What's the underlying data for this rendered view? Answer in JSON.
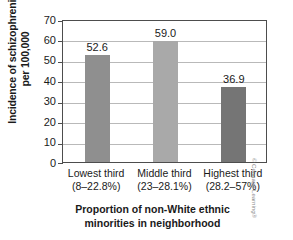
{
  "chart_data": {
    "type": "bar",
    "title": "",
    "categories": [
      "Lowest third",
      "Middle third",
      "Highest third"
    ],
    "category_ranges": [
      "(8–22.8%)",
      "(23–28.1%)",
      "(28.2–57%)"
    ],
    "values": [
      52.6,
      59.0,
      36.9
    ],
    "value_labels": [
      "52.6",
      "59.0",
      "36.9"
    ],
    "bar_colors": [
      "#8f8f8f",
      "#a9a9a9",
      "#757575"
    ],
    "xlabel_line1": "Proportion of non-White ethnic",
    "xlabel_line2": "minorities in neighborhood",
    "ylabel_line1": "Incidence of schizophrenia",
    "ylabel_line2": "per 100,000",
    "ylim": [
      0,
      70
    ],
    "ytick_values": [
      0,
      10,
      20,
      30,
      40,
      50,
      60,
      70
    ],
    "ytick_labels": [
      "0",
      "10",
      "20",
      "30",
      "40",
      "50",
      "60",
      "70"
    ],
    "grid": true,
    "legend": "none"
  },
  "credit": "© Cengage Learning®"
}
